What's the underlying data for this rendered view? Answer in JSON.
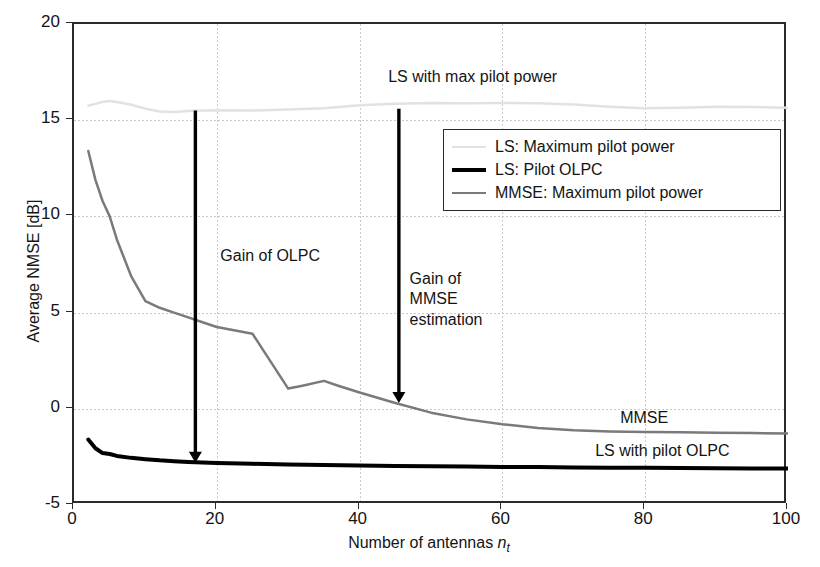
{
  "chart_data": {
    "type": "line",
    "title": "",
    "xlabel": "Number of antennas n_t",
    "xlabel_main": "Number of antennas ",
    "xlabel_var": "n",
    "xlabel_sub": "t",
    "ylabel": "Average NMSE [dB]",
    "xlim": [
      0,
      100
    ],
    "ylim": [
      -5,
      20
    ],
    "xticks": [
      0,
      20,
      40,
      60,
      80,
      100
    ],
    "yticks": [
      -5,
      0,
      5,
      10,
      15,
      20
    ],
    "xtick_labels": [
      "0",
      "20",
      "40",
      "60",
      "80",
      "100"
    ],
    "ytick_labels": [
      "-5",
      "0",
      "5",
      "10",
      "15",
      "20"
    ],
    "grid": true,
    "grid_style": "dotted",
    "legend_position": "upper right",
    "series": [
      {
        "name": "LS: Maximum pilot power",
        "color": "#e2e2e2",
        "width": 2.5,
        "x": [
          2,
          3,
          4,
          5,
          6,
          8,
          10,
          12,
          14,
          16,
          18,
          20,
          25,
          30,
          35,
          40,
          45,
          50,
          55,
          60,
          65,
          70,
          75,
          80,
          85,
          90,
          95,
          100
        ],
        "y": [
          15.75,
          15.85,
          15.95,
          16.0,
          15.95,
          15.8,
          15.6,
          15.45,
          15.42,
          15.48,
          15.5,
          15.52,
          15.5,
          15.55,
          15.62,
          15.78,
          15.85,
          15.9,
          15.88,
          15.9,
          15.88,
          15.82,
          15.7,
          15.62,
          15.65,
          15.7,
          15.68,
          15.65
        ]
      },
      {
        "name": "LS: Pilot OLPC",
        "color": "#000000",
        "width": 4.0,
        "x": [
          2,
          3,
          4,
          5,
          6,
          8,
          10,
          12,
          14,
          16,
          18,
          20,
          25,
          30,
          35,
          40,
          45,
          50,
          55,
          60,
          65,
          70,
          75,
          80,
          85,
          90,
          95,
          100
        ],
        "y": [
          -1.6,
          -2.05,
          -2.3,
          -2.35,
          -2.45,
          -2.55,
          -2.62,
          -2.68,
          -2.72,
          -2.76,
          -2.79,
          -2.82,
          -2.86,
          -2.9,
          -2.92,
          -2.95,
          -2.97,
          -2.99,
          -3.0,
          -3.02,
          -3.03,
          -3.05,
          -3.06,
          -3.07,
          -3.08,
          -3.09,
          -3.1,
          -3.1
        ]
      },
      {
        "name": "MMSE: Maximum pilot power",
        "color": "#7a7a7a",
        "width": 2.5,
        "x": [
          2,
          3,
          4,
          5,
          6,
          8,
          10,
          12,
          14,
          16,
          18,
          20,
          25,
          30,
          32,
          35,
          37,
          40,
          45,
          50,
          55,
          60,
          65,
          70,
          75,
          80,
          85,
          90,
          95,
          100
        ],
        "y": [
          13.4,
          11.9,
          10.8,
          10.0,
          8.8,
          6.9,
          5.6,
          5.25,
          5.0,
          4.75,
          4.5,
          4.25,
          3.9,
          1.05,
          1.2,
          1.45,
          1.2,
          0.85,
          0.3,
          -0.2,
          -0.55,
          -0.8,
          -1.0,
          -1.12,
          -1.18,
          -1.2,
          -1.22,
          -1.24,
          -1.26,
          -1.28
        ]
      }
    ],
    "annotations": [
      {
        "name": "ls-max-pilot-power-label",
        "text": "LS with max pilot power",
        "x": 44.0,
        "y": 17.2,
        "align": "left"
      },
      {
        "name": "gain-of-olpc-label",
        "text": "Gain of OLPC",
        "x": 20.5,
        "y": 7.9,
        "align": "left"
      },
      {
        "name": "gain-of-mmse-estimation-label",
        "text": "Gain of\nMMSE\nestimation",
        "x": 47.0,
        "y": 6.7,
        "align": "left"
      },
      {
        "name": "mmse-curve-label",
        "text": "MMSE",
        "x": 76.5,
        "y": -0.55,
        "align": "left"
      },
      {
        "name": "ls-with-pilot-olpc-label",
        "text": "LS with pilot OLPC",
        "x": 73.0,
        "y": -2.25,
        "align": "left"
      }
    ],
    "arrows": [
      {
        "name": "gain-of-olpc-arrow",
        "x": 17.0,
        "y_start": 15.5,
        "y_end": -2.8
      },
      {
        "name": "gain-of-mmse-arrow",
        "x": 45.5,
        "y_start": 15.6,
        "y_end": 0.3
      }
    ]
  },
  "legend": {
    "entries": [
      {
        "label": "LS: Maximum pilot power",
        "color": "#e2e2e2",
        "width": 2.5
      },
      {
        "label": "LS: Pilot OLPC",
        "color": "#000000",
        "width": 4.0
      },
      {
        "label": "MMSE: Maximum pilot power",
        "color": "#7a7a7a",
        "width": 2.5
      }
    ]
  }
}
